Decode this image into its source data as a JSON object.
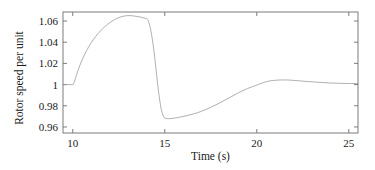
{
  "chart_data": {
    "type": "line",
    "title": "",
    "xlabel": "Time (s)",
    "ylabel": "Rotor speed per unit",
    "xlim": [
      9.47,
      25.5
    ],
    "ylim": [
      0.9543,
      1.0685
    ],
    "grid": false,
    "legend": null,
    "xticks": [
      10,
      15,
      20,
      25
    ],
    "xtick_labels": [
      "10",
      "15",
      "20",
      "25"
    ],
    "yticks": [
      0.96,
      0.98,
      1,
      1.02,
      1.04,
      1.06
    ],
    "ytick_labels": [
      "0.96",
      "0.98",
      "1",
      "1.02",
      "1.04",
      "1.06"
    ],
    "line_color": "#9a9a9a",
    "line_width": 0.8,
    "series": [
      {
        "name": "Rotor speed",
        "x": [
          9.47,
          9.8,
          10.0,
          10.05,
          10.15,
          10.3,
          10.5,
          10.75,
          11.0,
          11.25,
          11.5,
          11.75,
          12.0,
          12.25,
          12.5,
          12.75,
          13.0,
          13.25,
          13.5,
          13.75,
          13.95,
          14.05,
          14.1,
          14.2,
          14.3,
          14.4,
          14.5,
          14.6,
          14.7,
          14.8,
          14.9,
          15.0,
          15.2,
          15.5,
          15.8,
          16.2,
          16.6,
          17.0,
          17.5,
          18.0,
          18.5,
          19.0,
          19.5,
          20.0,
          20.3,
          20.6,
          20.9,
          21.2,
          21.5,
          21.8,
          22.2,
          22.6,
          23.0,
          23.5,
          24.0,
          24.5,
          25.0,
          25.5
        ],
        "y": [
          1.0,
          1.0,
          1.0,
          1.001,
          1.006,
          1.014,
          1.023,
          1.032,
          1.0395,
          1.0455,
          1.0505,
          1.0548,
          1.0583,
          1.0611,
          1.0632,
          1.0645,
          1.0651,
          1.0649,
          1.0643,
          1.0634,
          1.0625,
          1.0618,
          1.0605,
          1.0545,
          1.0455,
          1.0335,
          1.0185,
          1.0025,
          0.9885,
          0.9775,
          0.9712,
          0.9685,
          0.9678,
          0.9683,
          0.9692,
          0.9707,
          0.9725,
          0.9748,
          0.9785,
          0.9828,
          0.9875,
          0.9922,
          0.9963,
          0.9995,
          1.0015,
          1.0031,
          1.0039,
          1.0043,
          1.0044,
          1.0042,
          1.0037,
          1.0031,
          1.0026,
          1.002,
          1.0015,
          1.0012,
          1.001,
          1.001
        ]
      }
    ]
  },
  "axes": {
    "spine_color": "#6e6e6e",
    "tick_color": "#6e6e6e"
  }
}
